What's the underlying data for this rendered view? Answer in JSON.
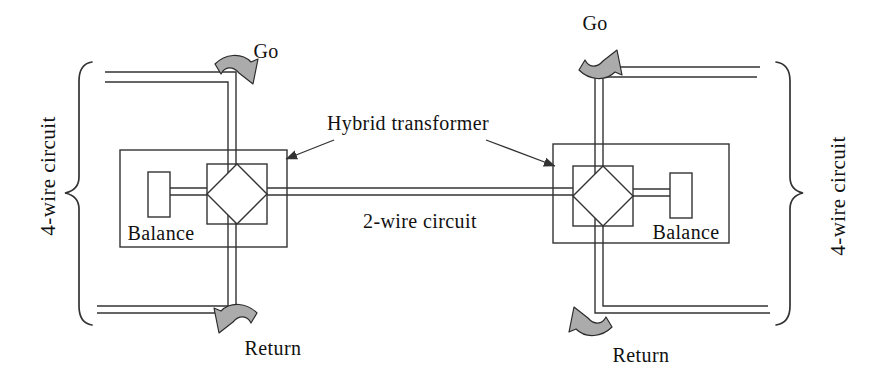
{
  "colors": {
    "line": "#333333",
    "arrow_fill": "#ababab",
    "arrow_outline": "#2b2b2b",
    "text": "#111111",
    "background": "#ffffff"
  },
  "left_unit": {
    "go_label": "Go",
    "return_label": "Return",
    "balance_label": "Balance",
    "four_wire_label": "4-wire circuit"
  },
  "right_unit": {
    "go_label": "Go",
    "return_label": "Return",
    "balance_label": "Balance",
    "four_wire_label": "4-wire circuit"
  },
  "center": {
    "hybrid_label": "Hybrid transformer",
    "two_wire_label": "2-wire circuit"
  }
}
